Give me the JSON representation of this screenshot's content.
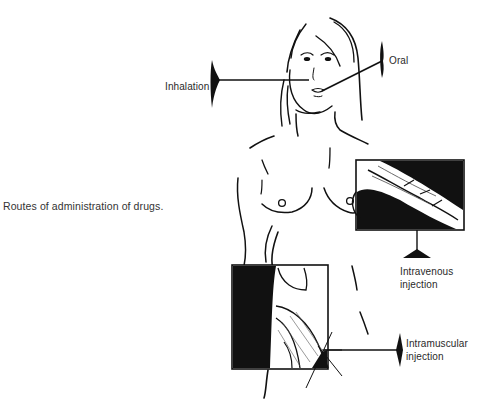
{
  "caption": "Routes of administration of drugs.",
  "routes": [
    {
      "id": "inhalation",
      "label": "Inhalation"
    },
    {
      "id": "oral",
      "label": "Oral"
    },
    {
      "id": "intravenous",
      "label_line1": "Intravenous",
      "label_line2": "injection"
    },
    {
      "id": "intramuscular",
      "label_line1": "Intramuscular",
      "label_line2": "injection"
    }
  ],
  "colors": {
    "ink": "#111111",
    "text": "#2a2a2a",
    "background": "#ffffff"
  }
}
